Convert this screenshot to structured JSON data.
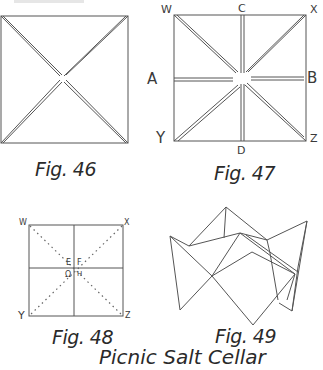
{
  "page": {
    "title": "Picnic Salt Cellar",
    "figures": [
      {
        "id": "fig46",
        "caption": "Fig. 46"
      },
      {
        "id": "fig47",
        "caption": "Fig. 47",
        "labels": {
          "w": "W",
          "c": "C",
          "x": "X",
          "a": "A",
          "b": "B",
          "y": "Y",
          "z": "Z",
          "d": "D"
        }
      },
      {
        "id": "fig48",
        "caption": "Fig. 48",
        "labels": {
          "w": "W",
          "x": "X",
          "y": "Y",
          "z": "Z",
          "e": "E",
          "f": "F",
          "g": "Ω",
          "h": "H"
        }
      },
      {
        "id": "fig49",
        "caption": "Fig. 49"
      }
    ]
  },
  "colors": {
    "line": "#555555",
    "text": "#2a2a2a"
  }
}
